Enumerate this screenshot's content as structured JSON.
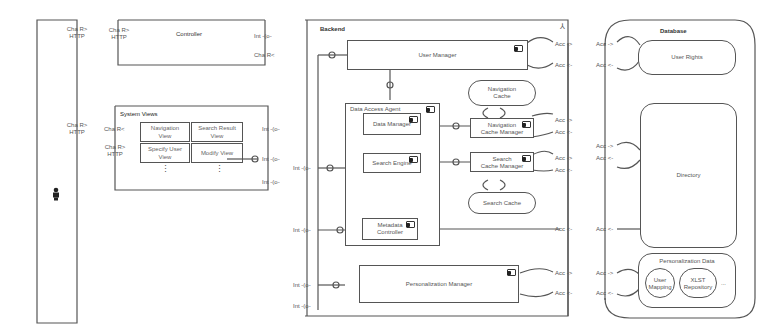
{
  "diagram": {
    "type": "UML component diagram",
    "client": {
      "icon": "actor-icon",
      "port": {
        "line1": "Cha R>",
        "line2": "HTTP"
      }
    },
    "controller": {
      "title": "Controller",
      "left_port": {
        "line1": "Cha R>",
        "line2": "HTTP"
      },
      "right_ports": [
        "Int -(o-",
        "Cha R<"
      ]
    },
    "system_views": {
      "title": "System Views",
      "left_ports": [
        {
          "line1": "Cha R<"
        },
        {
          "line1": "Cha R>",
          "line2": "HTTP"
        }
      ],
      "views": [
        {
          "line1": "Navigation",
          "line2": "View"
        },
        {
          "line1": "Search Result",
          "line2": "View"
        },
        {
          "line1": "Specify User",
          "line2": "View"
        },
        {
          "line1": "Modify View",
          "line2": ""
        }
      ],
      "ellipsis": "⋮",
      "right_ports": [
        "Int -(o-",
        "Int -(o-",
        "Int -(o-"
      ]
    },
    "backend": {
      "title": "Backend",
      "icon": "fork-icon",
      "left_ports": [
        "Int -(o-",
        "Int -(o-",
        "Int -(o-",
        "Int -(o-"
      ],
      "user_manager": "User Manager",
      "data_access_agent": {
        "title": "Data Access Agent",
        "data_manager": "Data Manager",
        "search_engine": "Search Engine",
        "metadata_controller": {
          "line1": "Metadata",
          "line2": "Controller"
        }
      },
      "navigation_cache": {
        "line1": "Navigation",
        "line2": "Cache"
      },
      "navigation_cache_manager": {
        "line1": "Navigation",
        "line2": "Cache Manager"
      },
      "search_cache_manager": {
        "line1": "Search",
        "line2": "Cache Manager"
      },
      "search_cache": "Search Cache",
      "personalization_manager": "Personalization Manager",
      "right_ports": [
        "Acc ->",
        "Acc <-",
        "Acc ->",
        "Acc <-",
        "Acc ->",
        "Acc <-",
        "Acc <-",
        "Acc ->",
        "Acc <-"
      ]
    },
    "database": {
      "title": "Database",
      "user_rights": "User Rights",
      "directory": "Directory",
      "personalization_data": {
        "title": "Personalization Data",
        "user_mapping": {
          "line1": "User",
          "line2": "Mapping"
        },
        "xlst_repository": {
          "line1": "XLST",
          "line2": "Repository"
        },
        "more": "..."
      },
      "left_ports": [
        "Acc ->",
        "Acc <-",
        "Acc ->",
        "Acc <-",
        "Acc <-",
        "Acc ->",
        "Acc <-"
      ]
    }
  }
}
